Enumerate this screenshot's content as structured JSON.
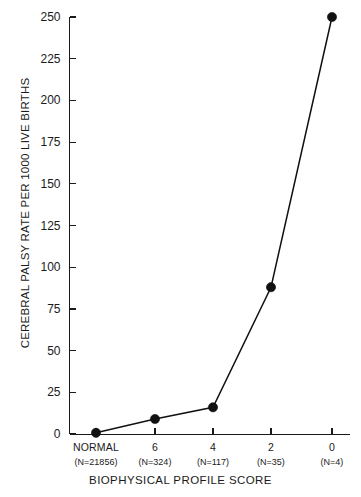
{
  "chart_data": {
    "type": "line",
    "title": "",
    "xlabel": "BIOPHYSICAL PROFILE SCORE",
    "ylabel": "CEREBRAL PALSY RATE PER 1000 LIVE BIRTHS",
    "categories": [
      "NORMAL",
      "6",
      "4",
      "2",
      "0"
    ],
    "category_sublabels": [
      "(N=21856)",
      "(N=324)",
      "(N=117)",
      "(N=35)",
      "(N=4)"
    ],
    "values": [
      0.7,
      9,
      16,
      88,
      250
    ],
    "series": [
      {
        "name": "Cerebral palsy rate",
        "values": [
          0.7,
          9,
          16,
          88,
          250
        ]
      }
    ],
    "ylim": [
      0,
      250
    ],
    "ytick_values": [
      0,
      25,
      50,
      75,
      100,
      125,
      150,
      175,
      200,
      225,
      250
    ],
    "ytick_labels": [
      "0",
      "25",
      "50",
      "75",
      "100",
      "125",
      "150",
      "175",
      "200",
      "225",
      "250"
    ],
    "grid": false,
    "legend": false,
    "legend_position": "none",
    "marker": "filled-circle",
    "line_color": "#111111",
    "marker_color": "#111111",
    "background_color": "#ffffff",
    "axis_color": "#1a1a1a",
    "tick_direction": "inward",
    "spines": [
      "left",
      "bottom"
    ]
  }
}
